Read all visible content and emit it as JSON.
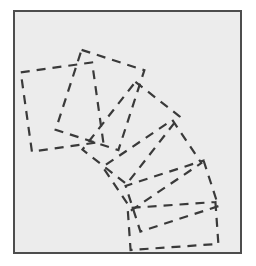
{
  "figure": {
    "canvas": {
      "width": 256,
      "height": 266
    },
    "frame": {
      "name": "plot-frame",
      "x": 14,
      "y": 11,
      "width": 227,
      "height": 242,
      "stroke": "#4d4d4d",
      "stroke_width": 2,
      "fill": "#ececec"
    },
    "background_fill": "#ececec",
    "geometry": {
      "center_x": 14,
      "center_y": 253,
      "inner_radius": 100,
      "outer_radius": 212,
      "start_angle_deg": 180,
      "end_angle_deg": 270,
      "angle_span_deg": 90,
      "sector_count": 6,
      "sector_boundaries_deg": [
        180,
        195,
        212,
        228,
        243,
        260,
        270
      ]
    },
    "stroke": {
      "sector_outline": "#2b2b2b",
      "sector_outline_width": 1.6,
      "dashed_overlay": "#3a3a3a",
      "dashed_overlay_width": 2.2,
      "dash_pattern": "9,7",
      "tick_mark": "#2b2b2b",
      "tick_mark_width": 1.6
    },
    "sectors": [
      {
        "id": "sector-1",
        "label": "Sector 1",
        "from_deg": 180,
        "to_deg": 195,
        "fill": "#efefef",
        "shade": "lightest"
      },
      {
        "id": "sector-2",
        "label": "Sector 2",
        "from_deg": 195,
        "to_deg": 212,
        "fill": "#dcdcdc",
        "shade": "light"
      },
      {
        "id": "sector-3",
        "label": "Sector 3",
        "from_deg": 212,
        "to_deg": 228,
        "fill": "#d2d2d2",
        "shade": "medium-light"
      },
      {
        "id": "sector-4",
        "label": "Sector 4",
        "from_deg": 228,
        "to_deg": 243,
        "fill": "#d8d8d8",
        "shade": "medium-light"
      },
      {
        "id": "sector-5",
        "label": "Sector 5",
        "from_deg": 243,
        "to_deg": 260,
        "fill": "#f2f2f2",
        "shade": "lightest"
      },
      {
        "id": "sector-6",
        "label": "Sector 6",
        "from_deg": 260,
        "to_deg": 270,
        "fill": "#b9b9b9",
        "shade": "darkest"
      }
    ],
    "overlay_boxes": [
      {
        "id": "box-1",
        "label": "Bounding box 1",
        "for_sector": "sector-1",
        "cx": 62,
        "cy": 107,
        "w": 72,
        "h": 80,
        "rotate_deg": -8
      },
      {
        "id": "box-2",
        "label": "Bounding box 2",
        "for_sector": "sector-2",
        "cx": 100,
        "cy": 100,
        "w": 66,
        "h": 84,
        "rotate_deg": 18
      },
      {
        "id": "box-3",
        "label": "Bounding box 3",
        "for_sector": "sector-3",
        "cx": 131,
        "cy": 133,
        "w": 56,
        "h": 86,
        "rotate_deg": 38
      },
      {
        "id": "box-4",
        "label": "Bounding box 4",
        "for_sector": "sector-4",
        "cx": 152,
        "cy": 165,
        "w": 52,
        "h": 84,
        "rotate_deg": 56
      },
      {
        "id": "box-5",
        "label": "Bounding box 5",
        "for_sector": "sector-5",
        "cx": 172,
        "cy": 196,
        "w": 48,
        "h": 82,
        "rotate_deg": 72
      },
      {
        "id": "box-6",
        "label": "Bounding box 6",
        "for_sector": "sector-6",
        "cx": 173,
        "cy": 226,
        "w": 42,
        "h": 88,
        "rotate_deg": 86
      }
    ],
    "tick_marks": [
      {
        "id": "tick-1",
        "at_deg": 195,
        "radius": 150
      },
      {
        "id": "tick-2",
        "at_deg": 212,
        "radius": 170
      },
      {
        "id": "tick-3",
        "at_deg": 228,
        "radius": 152
      },
      {
        "id": "tick-4",
        "at_deg": 243,
        "radius": 142
      },
      {
        "id": "tick-5",
        "at_deg": 260,
        "radius": 138
      }
    ]
  }
}
